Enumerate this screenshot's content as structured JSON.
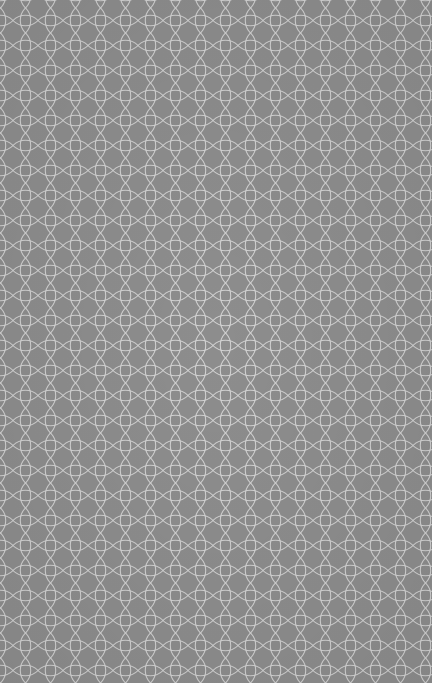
{
  "pattern": {
    "name": "interlocking-circles",
    "background_color": "#8d8d8d",
    "line_color": "#dcdcdc",
    "cell_size": 25,
    "offset_x": 13,
    "offset_y": 8
  }
}
